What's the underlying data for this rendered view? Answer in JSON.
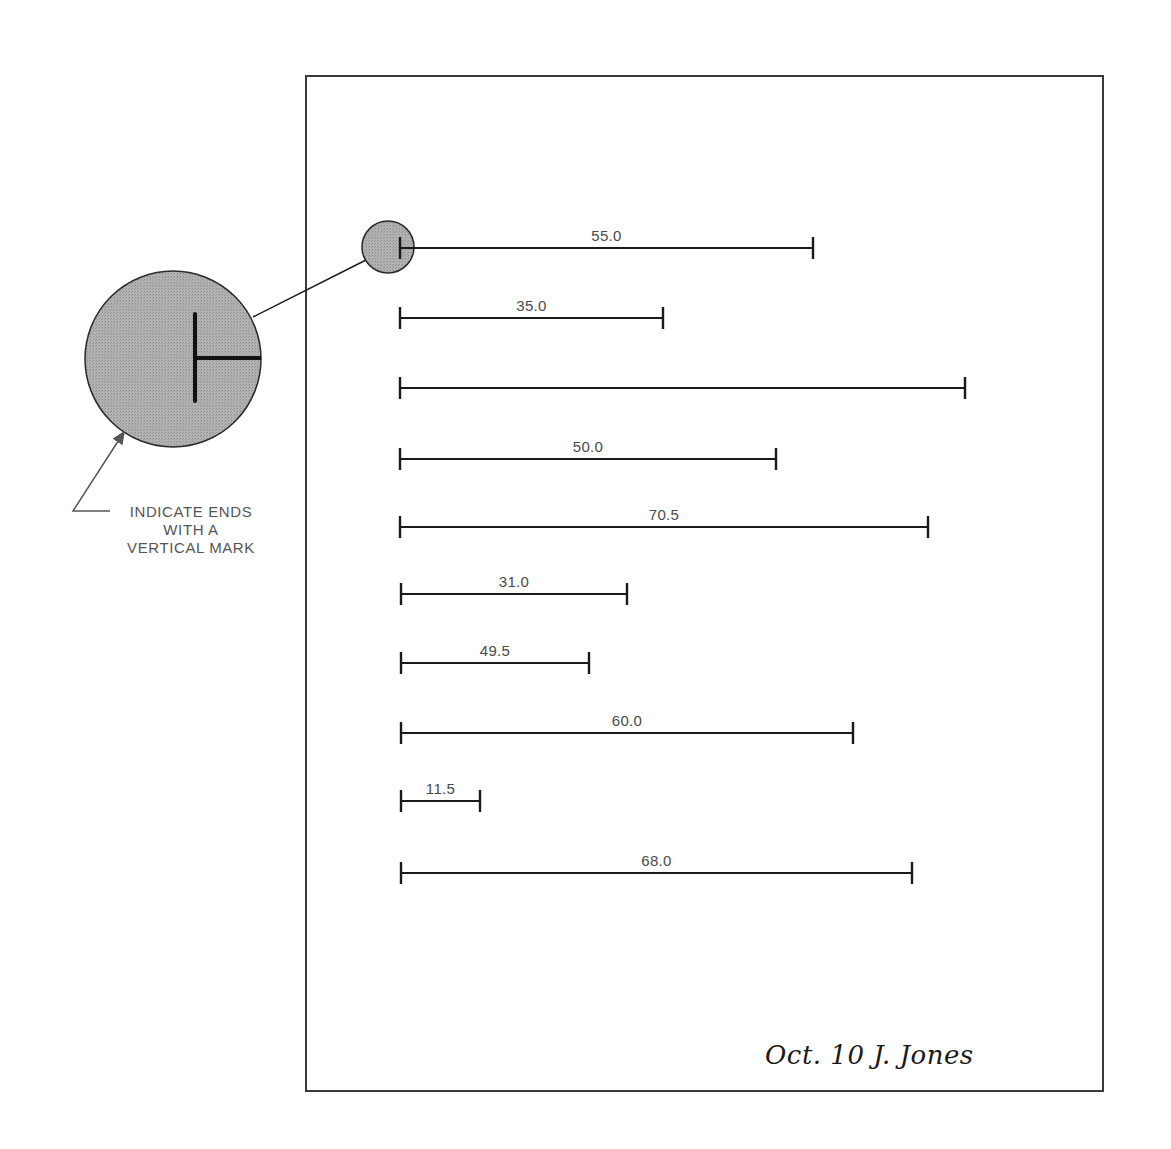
{
  "page": {
    "border_color": "#3a3a3a",
    "background": "#ffffff"
  },
  "bars": [
    {
      "label": "55.0",
      "x1": 400,
      "x2": 813,
      "y": 248
    },
    {
      "label": "35.0",
      "x1": 400,
      "x2": 663,
      "y": 318
    },
    {
      "label": "",
      "x1": 400,
      "x2": 965,
      "y": 388
    },
    {
      "label": "50.0",
      "x1": 400,
      "x2": 776,
      "y": 459
    },
    {
      "label": "70.5",
      "x1": 400,
      "x2": 928,
      "y": 527
    },
    {
      "label": "31.0",
      "x1": 401,
      "x2": 627,
      "y": 594
    },
    {
      "label": "49.5",
      "x1": 401,
      "x2": 589,
      "y": 663
    },
    {
      "label": "60.0",
      "x1": 401,
      "x2": 853,
      "y": 733
    },
    {
      "label": "11.5",
      "x1": 401,
      "x2": 480,
      "y": 801
    },
    {
      "label": "68.0",
      "x1": 401,
      "x2": 912,
      "y": 873
    }
  ],
  "magnifier": {
    "small_circle": {
      "cx": 388,
      "cy": 247,
      "r": 26
    },
    "large_circle": {
      "cx": 173,
      "cy": 359,
      "r": 88
    },
    "fill": "#a9a9a9",
    "stroke": "#2a2a2a"
  },
  "callout": {
    "lines": [
      "INDICATE ENDS",
      "WITH A",
      "VERTICAL MARK"
    ],
    "arrow_color": "#555555"
  },
  "signature": "Oct. 10  J. Jones"
}
